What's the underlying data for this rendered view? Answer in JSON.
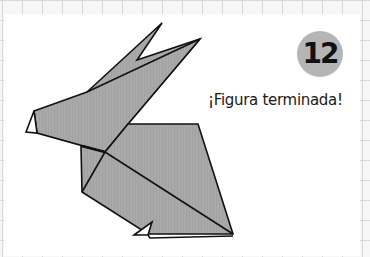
{
  "step": {
    "number": "12",
    "badge_color": "#b5b5b5"
  },
  "caption": "¡Figura terminada!",
  "figure": {
    "paper_color": "#a9a9a9",
    "outline_color": "#111111"
  },
  "background": {
    "grid_color": "#d8d8d8",
    "panel_color": "#ffffff"
  }
}
